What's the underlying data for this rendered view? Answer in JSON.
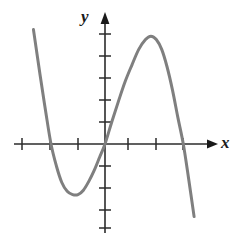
{
  "figure": {
    "name": "cubic-function-graph",
    "background_color": "#ffffff"
  },
  "axes": {
    "x_axis_label": "x",
    "y_axis_label": "y",
    "axis_color": "#2b2b2b",
    "origin_px": {
      "x": 105,
      "y": 144
    },
    "x_tick_spacing_px": 27,
    "y_tick_spacing_px": 22,
    "x_tick_positions_px": [
      22,
      50,
      78,
      128,
      156,
      183
    ],
    "y_tick_positions_px": [
      34,
      56,
      78,
      100,
      122,
      166,
      188,
      210,
      228
    ],
    "x_arrow_tip_px": 216,
    "y_arrow_tip_px": 12,
    "tick_half_length_px": 6
  },
  "chart_data": {
    "type": "line",
    "title": "",
    "xlabel": "x",
    "ylabel": "y",
    "grid": false,
    "legend": "none",
    "xlim": [
      -3.4,
      4.2
    ],
    "ylim": [
      -6.2,
      5.2
    ],
    "x_ticks": [
      -3,
      -2,
      -1,
      1,
      2,
      3
    ],
    "y_ticks": [
      5,
      4,
      3,
      2,
      1,
      -1,
      -2,
      -3,
      -4
    ],
    "annotations": [],
    "series": [
      {
        "name": "cubic curve",
        "color": "#7f7f7f",
        "line_width_px": 3,
        "x_intercepts": [
          -2.0,
          0.0,
          2.9
        ],
        "local_minimum": {
          "x": -1.0,
          "y": -2.3
        },
        "local_maximum": {
          "x": 1.7,
          "y": 4.9
        },
        "x": [
          -2.65,
          -2.4,
          -2.2,
          -2.0,
          -1.8,
          -1.6,
          -1.4,
          -1.2,
          -1.0,
          -0.8,
          -0.6,
          -0.4,
          -0.2,
          0.0,
          0.25,
          0.5,
          0.75,
          1.0,
          1.25,
          1.5,
          1.7,
          1.9,
          2.1,
          2.3,
          2.5,
          2.7,
          2.9,
          3.1,
          3.3
        ],
        "y": [
          5.2,
          3.1,
          1.5,
          0.0,
          -1.0,
          -1.75,
          -2.15,
          -2.3,
          -2.3,
          -2.1,
          -1.7,
          -1.2,
          -0.6,
          0.0,
          1.0,
          1.95,
          2.85,
          3.6,
          4.3,
          4.75,
          4.9,
          4.75,
          4.3,
          3.5,
          2.45,
          1.2,
          0.0,
          -1.6,
          -3.3
        ]
      }
    ]
  }
}
